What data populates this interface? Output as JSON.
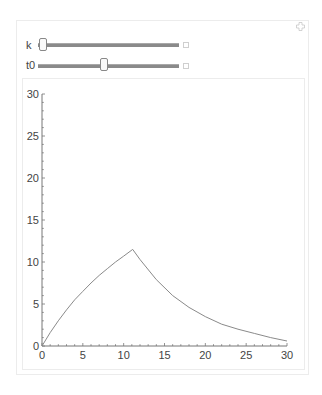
{
  "manipulate": {
    "controls": [
      {
        "label": "k",
        "value_fraction": 0.02
      },
      {
        "label": "t0",
        "value_fraction": 0.45
      }
    ],
    "options_icon": "plus-icon",
    "expand_icon": "expand-icon"
  },
  "chart_data": {
    "type": "line",
    "title": "",
    "xlabel": "",
    "ylabel": "",
    "xlim": [
      0,
      30
    ],
    "ylim": [
      0,
      30
    ],
    "x_ticks": [
      "0",
      "5",
      "10",
      "15",
      "20",
      "25",
      "30"
    ],
    "y_ticks": [
      "0",
      "5",
      "10",
      "15",
      "20",
      "25",
      "30"
    ],
    "grid": false,
    "legend": null,
    "series": [
      {
        "name": "curve",
        "x": [
          0,
          1,
          2,
          3,
          4,
          5,
          6,
          7,
          8,
          9,
          10,
          11.1,
          12,
          14,
          16,
          18,
          20,
          22,
          24,
          26,
          28,
          30
        ],
        "y": [
          0,
          1.6,
          3.0,
          4.3,
          5.5,
          6.5,
          7.5,
          8.4,
          9.2,
          10.0,
          10.7,
          11.5,
          10.3,
          7.9,
          6.0,
          4.6,
          3.5,
          2.6,
          2.0,
          1.5,
          1.0,
          0.6
        ]
      }
    ]
  }
}
